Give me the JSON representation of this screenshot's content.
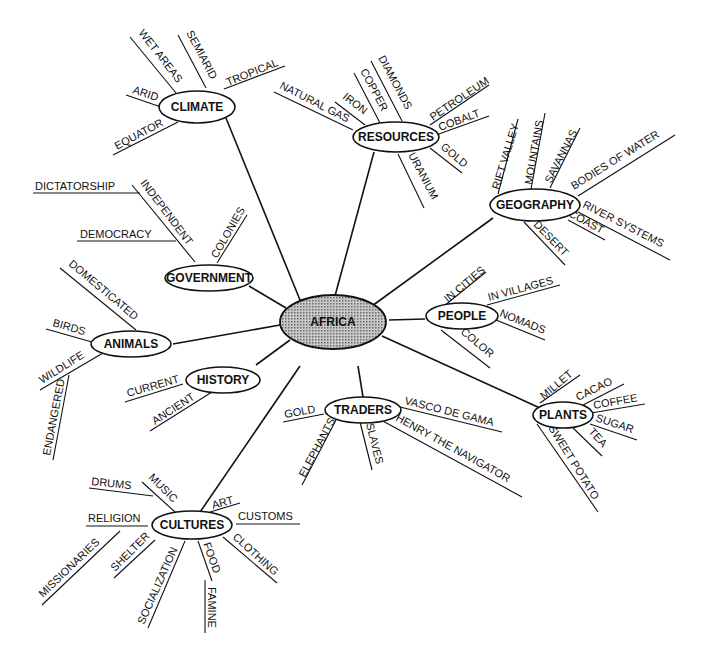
{
  "diagram": {
    "type": "concept-map",
    "center": {
      "label": "AFRICA",
      "fill": "#a8a8a8"
    },
    "nodes": [
      {
        "id": "climate",
        "label": "CLIMATE",
        "leaves": [
          "WET AREAS",
          "SEMIARID",
          "TROPICAL",
          "ARID",
          "EQUATOR"
        ]
      },
      {
        "id": "resources",
        "label": "RESOURCES",
        "leaves": [
          "NATURAL GAS",
          "IRON",
          "COPPER",
          "DIAMONDS",
          "PETROLEUM",
          "COBALT",
          "GOLD",
          "URANIUM"
        ]
      },
      {
        "id": "geography",
        "label": "GEOGRAPHY",
        "leaves": [
          "RIFT VALLEY",
          "MOUNTAINS",
          "SAVANNAS",
          "BODIES OF WATER",
          "RIVER SYSTEMS",
          "COAST",
          "DESERT"
        ]
      },
      {
        "id": "government",
        "label": "GOVERNMENT",
        "leaves": [
          "INDEPENDENT",
          "DICTATORSHIP",
          "DEMOCRACY",
          "COLONIES"
        ]
      },
      {
        "id": "animals",
        "label": "ANIMALS",
        "leaves": [
          "DOMESTICATED",
          "BIRDS",
          "WILDLIFE",
          "ENDANGERED"
        ]
      },
      {
        "id": "people",
        "label": "PEOPLE",
        "leaves": [
          "IN CITIES",
          "IN VILLAGES",
          "NOMADS",
          "COLOR"
        ]
      },
      {
        "id": "history",
        "label": "HISTORY",
        "leaves": [
          "CURRENT",
          "ANCIENT"
        ]
      },
      {
        "id": "traders",
        "label": "TRADERS",
        "leaves": [
          "GOLD",
          "VASCO DE GAMA",
          "HENRY THE NAVIGATOR",
          "SLAVES",
          "ELEPHANTS"
        ]
      },
      {
        "id": "plants",
        "label": "PLANTS",
        "leaves": [
          "MILLET",
          "CACAO",
          "COFFEE",
          "SUGAR",
          "TEA",
          "SWEET POTATO"
        ]
      },
      {
        "id": "cultures",
        "label": "CULTURES",
        "leaves": [
          "MUSIC",
          "DRUMS",
          "ART",
          "CUSTOMS",
          "RELIGION",
          "MISSIONARIES",
          "SHELTER",
          "SOCIALIZATION",
          "FOOD",
          "FAMINE",
          "CLOTHING"
        ]
      }
    ]
  }
}
